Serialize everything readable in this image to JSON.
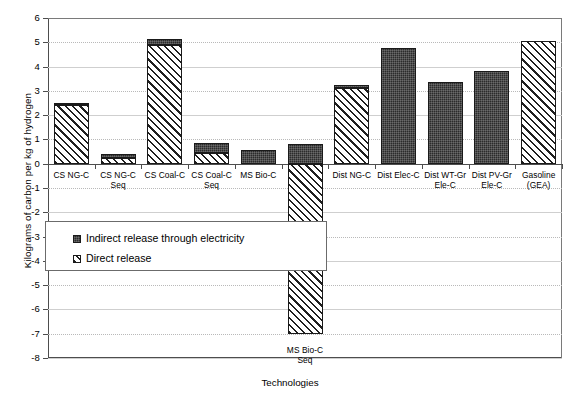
{
  "chart_data": {
    "type": "bar",
    "title": "",
    "xlabel": "Technologies",
    "ylabel": "Kilograms of carbon per kg of hydrogen",
    "ylim": [
      -8,
      6
    ],
    "yticks": [
      6,
      5,
      4,
      3,
      2,
      1,
      0,
      -1,
      -2,
      -3,
      -4,
      -5,
      -6,
      -7,
      -8
    ],
    "ytick_labels": [
      "6",
      "5",
      "4",
      "3",
      "2",
      "1",
      "0",
      "-1",
      "-2",
      "-3",
      "-4",
      "-5",
      "-6",
      "-7",
      "-8"
    ],
    "grid": true,
    "stacked": true,
    "legend_position": "inside-lower-left",
    "categories": [
      "CS NG-C",
      "CS NG-C Seq",
      "CS Coal-C",
      "CS Coal-C Seq",
      "MS Bio-C",
      "MS Bio-C Seq",
      "Dist NG-C",
      "Dist Elec-C",
      "Dist WT-Gr Ele-C",
      "Dist PV-Gr Ele-C",
      "Gasoline (GEA)"
    ],
    "category_label_lines": [
      [
        "CS NG-C"
      ],
      [
        "CS NG-C",
        "Seq"
      ],
      [
        "CS Coal-C"
      ],
      [
        "CS Coal-C",
        "Seq"
      ],
      [
        "MS Bio-C"
      ],
      [
        "MS Bio-C Seq"
      ],
      [
        "Dist NG-C"
      ],
      [
        "Dist Elec-C"
      ],
      [
        "Dist WT-Gr",
        "Ele-C"
      ],
      [
        "Dist PV-Gr",
        "Ele-C"
      ],
      [
        "Gasoline",
        "(GEA)"
      ]
    ],
    "series": [
      {
        "name": "Direct release",
        "pattern": "diagonal-hatch",
        "color": "#ffffff",
        "values": [
          2.42,
          0.25,
          4.9,
          0.45,
          0.0,
          -7.0,
          3.1,
          0.0,
          0.0,
          0.0,
          5.05
        ]
      },
      {
        "name": "Indirect release through electricity",
        "pattern": "solid-dark",
        "color": "#2b2b2b",
        "values": [
          0.1,
          0.17,
          0.22,
          0.4,
          0.58,
          0.8,
          0.15,
          4.75,
          3.35,
          3.8,
          0.0
        ]
      }
    ],
    "totals_positive": [
      2.52,
      0.42,
      5.12,
      0.85,
      0.58,
      0.8,
      3.25,
      4.75,
      3.35,
      3.8,
      5.05
    ],
    "totals_negative": [
      0,
      0,
      0,
      0,
      0,
      -7.0,
      0,
      0,
      0,
      0,
      0
    ]
  },
  "legend": {
    "items": [
      {
        "label": "Indirect release through electricity",
        "swatch": "solid-dark"
      },
      {
        "label": "Direct release",
        "swatch": "diagonal-hatch"
      }
    ]
  },
  "axes": {
    "x_title": "Technologies",
    "y_title": "Kilograms of carbon per kg of hydrogen"
  }
}
